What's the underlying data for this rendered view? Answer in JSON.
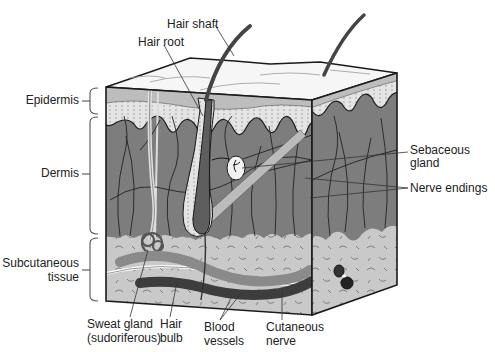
{
  "diagram": {
    "colors": {
      "stratum_top": "#f4f4f4",
      "epidermis_band": "#c9c9c9",
      "epidermis_dots": "#e2e2e2",
      "dermis": "#7d7d7d",
      "subcutaneous": "#c7c7c7",
      "hair": "#444444",
      "blood_vessel_dark": "#3d3d3d",
      "blood_vessel_light": "#8a8a8a",
      "nerve": "#ffffff",
      "outline": "#1a1a1a"
    },
    "layer_labels": {
      "epidermis": "Epidermis",
      "dermis": "Dermis",
      "subcutaneous_line1": "Subcutaneous",
      "subcutaneous_line2": "tissue"
    },
    "top_labels": {
      "hair_shaft": "Hair shaft",
      "hair_root": "Hair root"
    },
    "right_labels": {
      "sebaceous_line1": "Sebaceous",
      "sebaceous_line2": "gland",
      "nerve_endings": "Nerve endings"
    },
    "bottom_labels": {
      "sweat_gland_line1": "Sweat gland",
      "sweat_gland_line2": "(sudoriferous)",
      "hair_bulb_line1": "Hair",
      "hair_bulb_line2": "bulb",
      "blood_vessels_line1": "Blood",
      "blood_vessels_line2": "vessels",
      "cutaneous_nerve_line1": "Cutaneous",
      "cutaneous_nerve_line2": "nerve"
    }
  }
}
